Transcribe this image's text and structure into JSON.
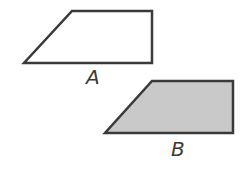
{
  "shapes": [
    {
      "id": "A",
      "label": "A",
      "type": "trapezoid",
      "points": "72,11 152,11 152,63 24,63",
      "fill": "#ffffff",
      "stroke": "#3a3a3a"
    },
    {
      "id": "B",
      "label": "B",
      "type": "trapezoid",
      "points": "152,81 233,81 233,133 105,133",
      "fill": "#c9c9c9",
      "stroke": "#3a3a3a"
    }
  ]
}
